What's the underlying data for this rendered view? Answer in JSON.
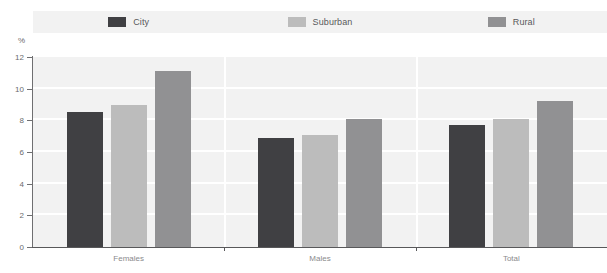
{
  "legend": {
    "items": [
      {
        "label": "City",
        "color": "#404043"
      },
      {
        "label": "Suburban",
        "color": "#bcbcbc"
      },
      {
        "label": "Rural",
        "color": "#919193"
      }
    ]
  },
  "axis": {
    "y_unit": "%",
    "y_ticks": [
      "12",
      "10",
      "8",
      "6",
      "4",
      "2",
      "0"
    ]
  },
  "chart_data": {
    "type": "bar",
    "title": "",
    "xlabel": "",
    "ylabel": "%",
    "ylim": [
      0,
      12
    ],
    "ytick_values": [
      0,
      2,
      4,
      6,
      8,
      10,
      12
    ],
    "grid": true,
    "legend_position": "top",
    "categories": [
      "Females",
      "Males",
      "Total"
    ],
    "series": [
      {
        "name": "City",
        "color": "#404043",
        "values": [
          8.5,
          6.9,
          7.7
        ]
      },
      {
        "name": "Suburban",
        "color": "#bcbcbc",
        "values": [
          9.0,
          7.1,
          8.1
        ]
      },
      {
        "name": "Rural",
        "color": "#919193",
        "values": [
          11.1,
          8.1,
          9.2
        ]
      }
    ]
  }
}
